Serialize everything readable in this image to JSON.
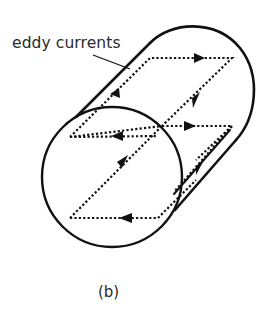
{
  "figure": {
    "label": "eddy currents",
    "caption": "(b)",
    "colors": {
      "stroke": "#111111",
      "text": "#2a2a2a",
      "background": "#ffffff"
    },
    "elements": [
      "cylinder-outline",
      "front-circular-face",
      "upper-eddy-current-loop",
      "lower-eddy-current-loop",
      "direction-arrows",
      "leader-line"
    ]
  }
}
